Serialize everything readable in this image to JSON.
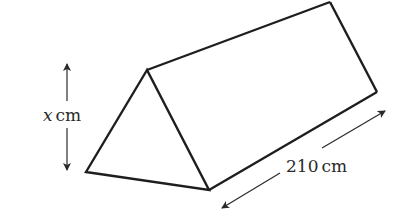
{
  "diagram": {
    "type": "triangular-prism",
    "colors": {
      "stroke": "#1e1e1e",
      "text": "#2a2a2a",
      "background": "#ffffff"
    },
    "labels": {
      "height_variable": "x",
      "height_unit": "cm",
      "length_value": "210",
      "length_unit": "cm"
    }
  }
}
